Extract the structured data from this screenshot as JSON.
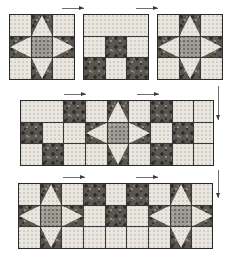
{
  "diagram": {
    "type": "quilt-construction",
    "fabrics": [
      {
        "id": "light",
        "name": "light speckled background",
        "color": "#e8e6df"
      },
      {
        "id": "medium",
        "name": "medium gray mottled print",
        "color": "#9d9a93"
      },
      {
        "id": "dark",
        "name": "dark floral print",
        "color": "#5a5751"
      }
    ],
    "outline_color": "#2b2b2b",
    "seam_line_color": "#3a3a3a",
    "arrow_color": "#3a3a3a",
    "rows": [
      {
        "id": "row-1",
        "label": "Row 1 - three separate units",
        "units": [
          {
            "id": "unit-1-1",
            "name": "sawtooth-star-block",
            "cells": 3
          },
          {
            "id": "unit-1-2",
            "name": "nine-patch-unit",
            "cells": 3
          },
          {
            "id": "unit-1-3",
            "name": "sawtooth-star-block",
            "cells": 3
          }
        ]
      },
      {
        "id": "row-2",
        "label": "Row 2 - units joined into a strip",
        "units": [
          {
            "id": "unit-2-1",
            "name": "nine-patch-unit",
            "cells": 3
          },
          {
            "id": "unit-2-2",
            "name": "sawtooth-star-block",
            "cells": 3
          },
          {
            "id": "unit-2-3",
            "name": "nine-patch-unit",
            "cells": 3
          }
        ]
      },
      {
        "id": "row-3",
        "label": "Row 3 - units joined into a strip",
        "units": [
          {
            "id": "unit-3-1",
            "name": "sawtooth-star-block",
            "cells": 3
          },
          {
            "id": "unit-3-2",
            "name": "nine-patch-unit",
            "cells": 3
          },
          {
            "id": "unit-3-3",
            "name": "sawtooth-star-block",
            "cells": 3
          }
        ]
      }
    ],
    "arrows": [
      {
        "id": "arrow-top-left",
        "direction": "right",
        "meaning": "press seam allowance to the right"
      },
      {
        "id": "arrow-top-right",
        "direction": "right",
        "meaning": "press seam allowance to the right"
      },
      {
        "id": "arrow-mid-left",
        "direction": "right",
        "meaning": "press seam allowance to the right"
      },
      {
        "id": "arrow-mid-right",
        "direction": "right",
        "meaning": "press seam allowance to the right"
      },
      {
        "id": "arrow-bottom-left",
        "direction": "right",
        "meaning": "press seam allowance to the right"
      },
      {
        "id": "arrow-bottom-right",
        "direction": "right",
        "meaning": "press seam allowance to the right"
      },
      {
        "id": "arrow-side-upper",
        "direction": "down",
        "meaning": "press row seam downward"
      },
      {
        "id": "arrow-side-lower",
        "direction": "down",
        "meaning": "press row seam downward"
      }
    ]
  }
}
